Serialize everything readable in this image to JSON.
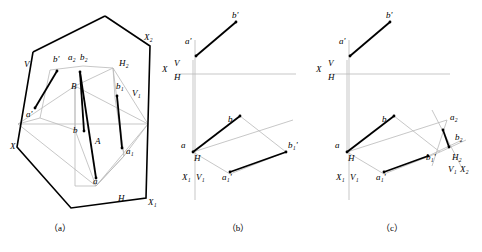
{
  "captions": [
    {
      "label": "（a）",
      "x": 60,
      "y": 231
    },
    {
      "label": "（b）",
      "x": 238,
      "y": 231
    },
    {
      "label": "（c）",
      "x": 392,
      "y": 231
    }
  ],
  "panel_a": {
    "name": "pictorial-view",
    "labels": [
      {
        "text": "b'",
        "x": 53,
        "y": 62,
        "italic": true
      },
      {
        "text": "a₂",
        "x": 68,
        "y": 60,
        "italic": true
      },
      {
        "text": "b₂",
        "x": 80,
        "y": 60,
        "italic": true
      },
      {
        "text": "X₂",
        "x": 144,
        "y": 40,
        "italic": true
      },
      {
        "text": "H₂",
        "x": 119,
        "y": 66,
        "italic": true
      },
      {
        "text": "V",
        "x": 24,
        "y": 67,
        "italic": true
      },
      {
        "text": "B",
        "x": 71,
        "y": 89,
        "italic": true
      },
      {
        "text": "b₁",
        "x": 116,
        "y": 89,
        "italic": true
      },
      {
        "text": "V₁",
        "x": 132,
        "y": 96,
        "italic": true
      },
      {
        "text": "a'",
        "x": 26,
        "y": 117,
        "italic": true
      },
      {
        "text": "b",
        "x": 73,
        "y": 133,
        "italic": true
      },
      {
        "text": "A",
        "x": 95,
        "y": 144,
        "italic": true
      },
      {
        "text": "a₁",
        "x": 126,
        "y": 154,
        "italic": true
      },
      {
        "text": "X",
        "x": 10,
        "y": 149,
        "italic": true
      },
      {
        "text": "a",
        "x": 93,
        "y": 184,
        "italic": true
      },
      {
        "text": "H",
        "x": 118,
        "y": 201,
        "italic": true
      },
      {
        "text": "X₁",
        "x": 148,
        "y": 205,
        "italic": true
      }
    ]
  },
  "panel_b": {
    "name": "two-view-projection",
    "labels": [
      {
        "text": "b'",
        "x": 232,
        "y": 18,
        "italic": true
      },
      {
        "text": "a'",
        "x": 185,
        "y": 44,
        "italic": true
      },
      {
        "text": "X",
        "x": 162,
        "y": 72,
        "italic": true
      },
      {
        "text": "V",
        "x": 174,
        "y": 66,
        "italic": true
      },
      {
        "text": "H",
        "x": 174,
        "y": 80,
        "italic": true
      },
      {
        "text": "b",
        "x": 228,
        "y": 122,
        "italic": true
      },
      {
        "text": "a",
        "x": 181,
        "y": 148,
        "italic": true
      },
      {
        "text": "b₁'",
        "x": 288,
        "y": 148,
        "italic": true
      },
      {
        "text": "X₁",
        "x": 182,
        "y": 180,
        "italic": true
      },
      {
        "text": "V₁",
        "x": 196,
        "y": 180,
        "italic": true
      },
      {
        "text": "H",
        "x": 194,
        "y": 161,
        "italic": true
      },
      {
        "text": "a₁'",
        "x": 222,
        "y": 180,
        "italic": true
      }
    ]
  },
  "panel_c": {
    "name": "three-view-projection",
    "labels": [
      {
        "text": "b'",
        "x": 386,
        "y": 18,
        "italic": true
      },
      {
        "text": "a'",
        "x": 339,
        "y": 44,
        "italic": true
      },
      {
        "text": "X",
        "x": 316,
        "y": 72,
        "italic": true
      },
      {
        "text": "V",
        "x": 328,
        "y": 66,
        "italic": true
      },
      {
        "text": "H",
        "x": 328,
        "y": 80,
        "italic": true
      },
      {
        "text": "b",
        "x": 382,
        "y": 122,
        "italic": true
      },
      {
        "text": "a",
        "x": 335,
        "y": 148,
        "italic": true
      },
      {
        "text": "a₂",
        "x": 450,
        "y": 120,
        "italic": true
      },
      {
        "text": "b₂",
        "x": 455,
        "y": 140,
        "italic": true
      },
      {
        "text": "b₁'",
        "x": 426,
        "y": 160,
        "italic": true
      },
      {
        "text": "H₂",
        "x": 452,
        "y": 160,
        "italic": true
      },
      {
        "text": "X₂",
        "x": 460,
        "y": 172,
        "italic": true
      },
      {
        "text": "V₁",
        "x": 448,
        "y": 172,
        "italic": true
      },
      {
        "text": "X₁",
        "x": 336,
        "y": 180,
        "italic": true
      },
      {
        "text": "V₁",
        "x": 350,
        "y": 180,
        "italic": true
      },
      {
        "text": "H",
        "x": 348,
        "y": 161,
        "italic": true
      },
      {
        "text": "a₁'",
        "x": 376,
        "y": 180,
        "italic": true
      }
    ]
  },
  "colors": {
    "stroke_heavy": "#000000",
    "stroke_light": "#b9b9b9"
  }
}
